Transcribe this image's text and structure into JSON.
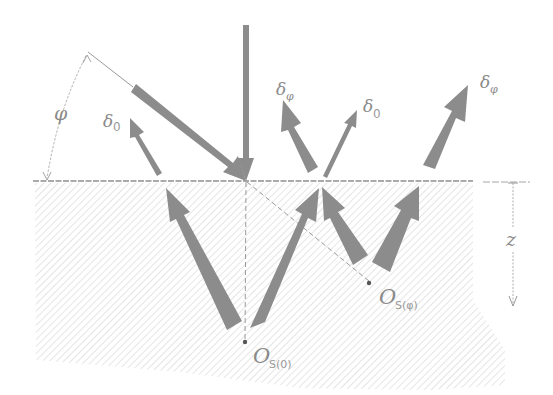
{
  "figure": {
    "colors": {
      "arrow": "#8c8c8c",
      "arrow_light": "#a3a3a3",
      "line": "#9a9a9a",
      "hatch": "#c8c8c8",
      "label": "#8a8a8a",
      "background": "#ffffff"
    }
  },
  "labels": {
    "angle": "φ",
    "delta_0_left": "δ",
    "delta_0_left_sub": "0",
    "delta_phi_mid": "δ",
    "delta_phi_mid_sub": "φ",
    "delta_0_mid": "δ",
    "delta_0_mid_sub": "0",
    "delta_phi_right": "δ",
    "delta_phi_right_sub": "φ",
    "depth": "z",
    "source_0": "O",
    "source_0_sub": "S(0)",
    "source_phi": "O",
    "source_phi_sub": "S(φ)"
  }
}
